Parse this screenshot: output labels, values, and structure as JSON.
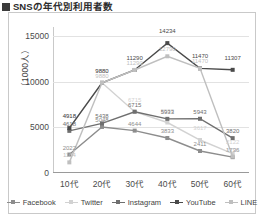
{
  "heading": {
    "text": "SNSの年代別利用者数",
    "marker": "square-bullet"
  },
  "chart_data": {
    "type": "line",
    "title": "SNSの年代別利用者数",
    "xlabel": "",
    "ylabel": "（1000人）",
    "categories": [
      "10代",
      "20代",
      "30代",
      "40代",
      "50代",
      "60代"
    ],
    "ylim": [
      0,
      16000
    ],
    "yticks": [
      0,
      5000,
      10000,
      15000
    ],
    "ytick_labels": [
      "0",
      "5000",
      "10000",
      "15000"
    ],
    "grid": true,
    "legend_position": "bottom",
    "series": [
      {
        "name": "Facebook",
        "color": "#8d8d8d",
        "values": [
          2022,
          5048,
          4644,
          3833,
          2411,
          1736
        ],
        "labels": [
          "2022",
          "5048",
          "4644",
          "3833",
          "2411",
          "1736"
        ]
      },
      {
        "name": "Twitter",
        "color": "#d2d2d2",
        "values": [
          4918,
          9882,
          6715,
          5533,
          3617,
          2122
        ],
        "labels": [
          "4918",
          "9882",
          "6715",
          "5533",
          "3617",
          "2122"
        ]
      },
      {
        "name": "Instagram",
        "color": "#6f6f6f",
        "values": [
          4618,
          5438,
          6715,
          5933,
          5943,
          3820
        ],
        "labels": [
          "4618",
          "5438",
          "6715",
          "5933",
          "5943",
          "3820"
        ]
      },
      {
        "name": "YouTube",
        "color": "#4a4a4a",
        "values": [
          4918,
          9880,
          11290,
          14234,
          11470,
          11307
        ],
        "labels": [
          "4918",
          "9880",
          "11290",
          "14234",
          "11470",
          "11307"
        ]
      },
      {
        "name": "LINE",
        "color": "#bfbfbf",
        "values": [
          1164,
          9880,
          11290,
          12790,
          11470,
          1796
        ],
        "labels": [
          "1164",
          "9880",
          "11290",
          "12790",
          "11470",
          "1796"
        ]
      }
    ]
  },
  "legend": {
    "items": [
      {
        "label": "Facebook",
        "color": "#8d8d8d"
      },
      {
        "label": "Twitter",
        "color": "#d2d2d2"
      },
      {
        "label": "Instagram",
        "color": "#6f6f6f"
      },
      {
        "label": "YouTube",
        "color": "#4a4a4a"
      },
      {
        "label": "LINE",
        "color": "#bfbfbf"
      }
    ]
  }
}
